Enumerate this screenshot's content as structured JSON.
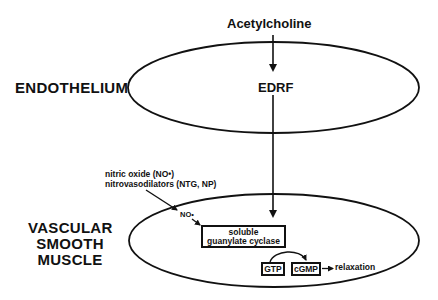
{
  "diagram": {
    "title_top": "Acetylcholine",
    "regions": {
      "endothelium": {
        "label": "ENDOTHELIUM",
        "inner_label": "EDRF"
      },
      "vascular_smooth_muscle": {
        "label_lines": [
          "VASCULAR",
          "SMOOTH",
          "MUSCLE"
        ]
      }
    },
    "external_inputs": {
      "line1": "nitric oxide (NO•)",
      "line2": "nitrovasodilators (NTG, NP)"
    },
    "nodes": {
      "no_radical": "NO•",
      "enzyme_line1": "soluble",
      "enzyme_line2": "guanylate cyclase",
      "substrate": "GTP",
      "product": "cGMP",
      "outcome": "relaxation"
    },
    "edges": [
      {
        "from": "Acetylcholine",
        "to": "EDRF"
      },
      {
        "from": "EDRF",
        "to": "soluble guanylate cyclase"
      },
      {
        "from": "nitric oxide / nitrovasodilators",
        "to": "NO•"
      },
      {
        "from": "NO•",
        "to": "soluble guanylate cyclase"
      },
      {
        "from": "GTP",
        "to": "cGMP"
      },
      {
        "from": "cGMP",
        "to": "relaxation"
      }
    ],
    "colors": {
      "stroke": "#111111",
      "background": "#ffffff"
    }
  }
}
